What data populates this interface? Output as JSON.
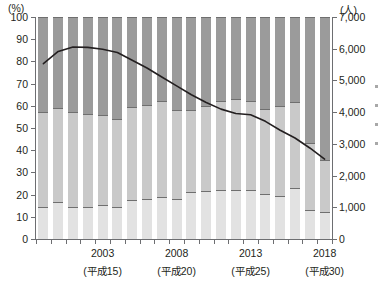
{
  "chart_data": {
    "type": "bar",
    "title": "",
    "subtitle": "",
    "left_axis": {
      "unit_label": "(%)",
      "min": 0,
      "max": 100,
      "ticks": [
        0,
        10,
        20,
        30,
        40,
        50,
        60,
        70,
        80,
        90,
        100
      ],
      "tick_labels": [
        "0",
        "10",
        "20",
        "30",
        "40",
        "50",
        "60",
        "70",
        "80",
        "90",
        "100"
      ]
    },
    "right_axis": {
      "unit_label": "(人)",
      "min": 0,
      "max": 7000,
      "ticks": [
        0,
        1000,
        2000,
        3000,
        4000,
        5000,
        6000,
        7000
      ],
      "tick_labels": [
        "0",
        "1,000",
        "2,000",
        "3,000",
        "4,000",
        "5,000",
        "6,000",
        "7,000"
      ]
    },
    "xlabel": "",
    "ylabel": "",
    "grid": false,
    "legend_position": "right-outside-cropped",
    "x_tick_count": 20,
    "categories": [
      "1999",
      "2000",
      "2001",
      "2002",
      "2003",
      "2004",
      "2005",
      "2006",
      "2007",
      "2008",
      "2009",
      "2010",
      "2011",
      "2012",
      "2013",
      "2014",
      "2015",
      "2016",
      "2017",
      "2018"
    ],
    "x_axis_labels": [
      {
        "index": 4,
        "year": "2003",
        "era": "(平成15)"
      },
      {
        "index": 9,
        "year": "2008",
        "era": "(平成20)"
      },
      {
        "index": 14,
        "year": "2013",
        "era": "(平成25)"
      },
      {
        "index": 19,
        "year": "2018",
        "era": "(平成30)"
      }
    ],
    "series": [
      {
        "name": "bottom-segment",
        "axis": "left",
        "stack": "bars",
        "color": "#e2e2e2",
        "values": [
          14,
          16.5,
          14,
          14,
          15,
          14,
          17.5,
          18,
          18.5,
          18,
          21,
          21.5,
          22,
          22,
          22,
          20,
          19,
          23,
          13,
          12
        ]
      },
      {
        "name": "middle-segment",
        "axis": "left",
        "stack": "bars",
        "color": "#c9c9c9",
        "values": [
          43,
          42.5,
          43,
          42,
          40.5,
          40,
          42,
          42.5,
          43.5,
          40,
          37,
          38.5,
          40,
          41,
          40,
          38.5,
          41,
          38.5,
          30,
          23
        ]
      },
      {
        "name": "top-segment",
        "axis": "left",
        "stack": "bars",
        "color": "#9b9b9b",
        "values": [
          43,
          41,
          43,
          44,
          44.5,
          46,
          40.5,
          39.5,
          38,
          42,
          42,
          40,
          38,
          37,
          38,
          41.5,
          40,
          38.5,
          57,
          65
        ]
      },
      {
        "name": "rate-line",
        "axis": "left",
        "type": "line",
        "color": "#231f20",
        "values": [
          79,
          84.5,
          86.5,
          86.3,
          85.5,
          84,
          80.5,
          77,
          73,
          69,
          65,
          61.5,
          58.5,
          56.5,
          56,
          53,
          49,
          45.5,
          41,
          36
        ]
      }
    ],
    "line_values_right_axis_equivalent": [
      5530,
      5915,
      6055,
      6041,
      5985,
      5880,
      5635,
      5390,
      5110,
      4830,
      4550,
      4305,
      4095,
      3955,
      3920,
      3710,
      3430,
      3185,
      2870,
      2520
    ]
  },
  "axes": {
    "left_unit": "(%)",
    "right_unit": "(人)"
  }
}
